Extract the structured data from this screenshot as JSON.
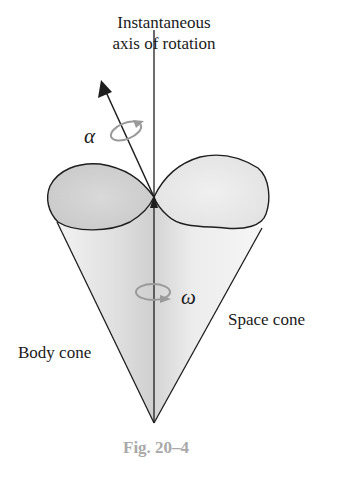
{
  "diagram": {
    "axis_label_line1": "Instantaneous",
    "axis_label_line2": "axis of rotation",
    "alpha_symbol": "α",
    "omega_symbol": "ω",
    "space_cone_label": "Space cone",
    "body_cone_label": "Body cone",
    "caption": "Fig. 20–4"
  },
  "colors": {
    "line": "#1e1e1e",
    "fill_light": "#ececec",
    "fill_mid": "#d8d8d8",
    "rotation_arrow": "#9a9a9a",
    "caption": "#a9a9a9"
  }
}
